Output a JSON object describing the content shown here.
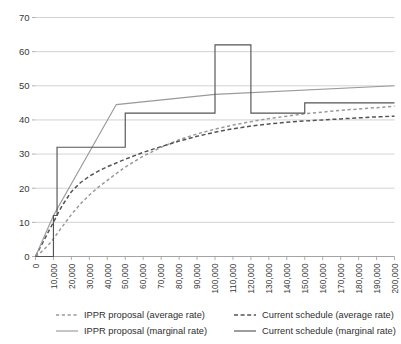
{
  "chart_data": {
    "type": "line",
    "title": "",
    "subtitle": "",
    "xlabel": "",
    "ylabel": "",
    "xlim": [
      0,
      200000
    ],
    "ylim": [
      0,
      70
    ],
    "grid": true,
    "legend_position": "bottom",
    "y_ticks": [
      0,
      10,
      20,
      30,
      40,
      50,
      60,
      70
    ],
    "x_ticks": [
      0,
      10000,
      20000,
      30000,
      40000,
      50000,
      60000,
      70000,
      80000,
      90000,
      100000,
      110000,
      120000,
      130000,
      140000,
      150000,
      160000,
      170000,
      180000,
      190000,
      200000
    ],
    "x_tick_labels": [
      "0",
      "10,000",
      "20,000",
      "30,000",
      "40,000",
      "50,000",
      "60,000",
      "70,000",
      "80,000",
      "90,000",
      "100,000",
      "110,000",
      "120,000",
      "130,000",
      "140,000",
      "150,000",
      "160,000",
      "170,000",
      "180,000",
      "190,000",
      "200,000"
    ],
    "y_tick_labels": [
      "0",
      "10",
      "20",
      "30",
      "40",
      "50",
      "60",
      "70"
    ],
    "colors": {
      "ippr": "#9a9a9a",
      "current": "#545454",
      "gridline": "#c8c8c8",
      "axis": "#9a9a9a",
      "text": "#3a3a3a"
    },
    "series": [
      {
        "name": "IPPR proposal (average rate)",
        "style": "dashed",
        "color": "#9a9a9a",
        "x": [
          0,
          2500,
          5000,
          7500,
          10000,
          12500,
          15000,
          20000,
          25000,
          30000,
          35000,
          40000,
          45000,
          50000,
          60000,
          70000,
          80000,
          90000,
          100000,
          110000,
          120000,
          130000,
          140000,
          150000,
          160000,
          170000,
          180000,
          190000,
          200000
        ],
        "values": [
          0,
          1.0,
          2.2,
          3.6,
          5.2,
          7.0,
          8.8,
          12.3,
          15.4,
          18.0,
          20.3,
          22.3,
          24.3,
          26.2,
          29.4,
          32.0,
          34.2,
          35.9,
          37.3,
          38.5,
          39.5,
          40.4,
          41.1,
          41.8,
          42.3,
          42.8,
          43.2,
          43.6,
          44.0
        ]
      },
      {
        "name": "Current schedule (average rate)",
        "style": "dashed",
        "color": "#545454",
        "x": [
          0,
          2500,
          5000,
          7500,
          10000,
          12500,
          15000,
          20000,
          25000,
          30000,
          35000,
          40000,
          45000,
          50000,
          60000,
          70000,
          80000,
          90000,
          100000,
          110000,
          120000,
          130000,
          140000,
          150000,
          160000,
          170000,
          180000,
          190000,
          200000
        ],
        "values": [
          0,
          2.6,
          5.0,
          7.6,
          10.0,
          12.6,
          15.0,
          19.0,
          21.6,
          23.5,
          25.0,
          26.3,
          27.4,
          28.5,
          30.5,
          32.2,
          33.8,
          35.2,
          36.4,
          37.4,
          38.2,
          38.8,
          39.3,
          39.7,
          40.0,
          40.3,
          40.6,
          40.9,
          41.1
        ]
      },
      {
        "name": "IPPR proposal (marginal rate)",
        "style": "solid",
        "color": "#9a9a9a",
        "x": [
          0,
          10000,
          45000,
          100000,
          200000
        ],
        "values": [
          0,
          12.0,
          44.5,
          47.5,
          50.0
        ]
      },
      {
        "name": "Current schedule (marginal rate)",
        "style": "solid",
        "color": "#545454",
        "step": true,
        "x": [
          0,
          10000,
          12000,
          50000,
          100000,
          120000,
          150000,
          200000
        ],
        "values": [
          0,
          12.0,
          32.0,
          42.0,
          62.0,
          42.0,
          45.0,
          45.0
        ]
      }
    ]
  },
  "legend": {
    "items": [
      {
        "label": "IPPR proposal (average rate)",
        "style": "dashed",
        "color": "#9a9a9a",
        "icon": "dashed-line-swatch"
      },
      {
        "label": "Current schedule (average rate)",
        "style": "dashed",
        "color": "#545454",
        "icon": "dashed-line-swatch"
      },
      {
        "label": "IPPR proposal (marginal rate)",
        "style": "solid",
        "color": "#9a9a9a",
        "icon": "solid-line-swatch"
      },
      {
        "label": "Current schedule (marginal rate)",
        "style": "solid",
        "color": "#545454",
        "icon": "solid-line-swatch"
      }
    ]
  }
}
